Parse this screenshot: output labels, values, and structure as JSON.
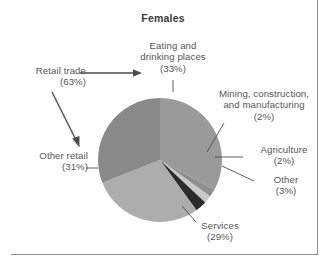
{
  "chart_data": {
    "type": "pie",
    "title": "Females",
    "xlabel": "",
    "ylabel": "",
    "legend_position": "callout-labels",
    "grid": false,
    "categories": [
      "Eating and drinking places",
      "Mining, construction, and manufacturing",
      "Agriculture",
      "Other",
      "Services",
      "Other retail"
    ],
    "values": [
      33,
      2,
      2,
      3,
      29,
      31
    ],
    "slices": [
      {
        "name": "eating-and-drinking-places",
        "label_line1": "Eating and",
        "label_line2": "drinking places",
        "percent_text": "(33%)",
        "value": 33,
        "color": "#9a9a9a",
        "start_angle": 0,
        "end_angle": 118.8
      },
      {
        "name": "mining-construction-and-manufacturing",
        "label_line1": "Mining, construction,",
        "label_line2": "and manufacturing",
        "percent_text": "(2%)",
        "value": 2,
        "color": "#8f8f8f",
        "start_angle": 118.8,
        "end_angle": 126.0
      },
      {
        "name": "agriculture",
        "label_line1": "Agriculture",
        "label_line2": "",
        "percent_text": "(2%)",
        "value": 2,
        "color": "#c9c9c9",
        "start_angle": 126.0,
        "end_angle": 133.2
      },
      {
        "name": "other",
        "label_line1": "Other",
        "label_line2": "",
        "percent_text": "(3%)",
        "value": 3,
        "color": "#2b2b2b",
        "start_angle": 133.2,
        "end_angle": 144.0
      },
      {
        "name": "services",
        "label_line1": "Services",
        "label_line2": "",
        "percent_text": "(29%)",
        "value": 29,
        "color": "#adadad",
        "start_angle": 144.0,
        "end_angle": 248.4
      },
      {
        "name": "other-retail",
        "label_line1": "Other retail",
        "label_line2": "",
        "percent_text": "(31%)",
        "value": 31,
        "color": "#898989",
        "start_angle": 248.4,
        "end_angle": 360.0
      }
    ],
    "annotations": [
      {
        "name": "retail-trade",
        "label_line1": "Retail trade",
        "percent_text": "(63%)",
        "value": 63,
        "note": "bracketing annotation covering eating-and-drinking-places plus other-retail"
      }
    ]
  }
}
